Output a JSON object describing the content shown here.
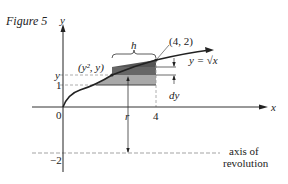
{
  "figure": {
    "caption": "Figure 5",
    "axis_y_label": "y",
    "axis_x_label": "x",
    "origin_label": "0",
    "tick_y_label": "y",
    "tick_one_label": "1",
    "tick_r_label": "r",
    "tick_four_label": "4",
    "tick_neg2_label": "−2",
    "point_label": "(y², y)",
    "endpoint_label": "(4, 2)",
    "curve_label": "y = √x",
    "width_label": "h",
    "thickness_label": "dy",
    "axis_revolution_line1": "axis of",
    "axis_revolution_line2": "revolution",
    "colors": {
      "ink": "#222222",
      "dark_shade": "#555555",
      "light_shade": "#9a9a9a",
      "dashed": "#888888"
    }
  }
}
